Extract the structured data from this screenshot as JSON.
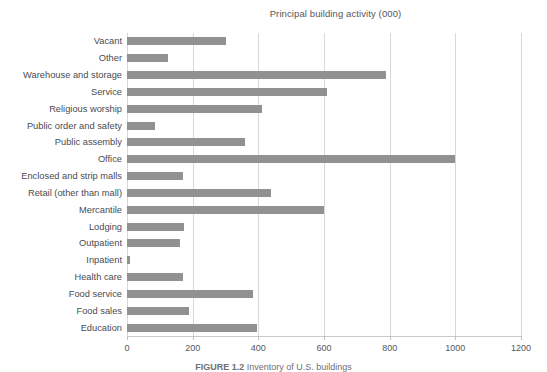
{
  "chart_data": {
    "type": "bar",
    "orientation": "horizontal",
    "title": "Principal building activity (000)",
    "xlabel": "",
    "ylabel": "",
    "xlim": [
      0,
      1200
    ],
    "xticks": [
      0,
      200,
      400,
      600,
      800,
      1000,
      1200
    ],
    "xtick_labels": [
      "0",
      "200",
      "400",
      "600",
      "800",
      "1000",
      "1200"
    ],
    "grid": "vertical",
    "legend": "none",
    "bar_color": "#919191",
    "categories": [
      "Vacant",
      "Other",
      "Warehouse and storage",
      "Service",
      "Religious worship",
      "Public order and safety",
      "Public assembly",
      "Office",
      "Enclosed and strip malls",
      "Retail (other than mall)",
      "Mercantile",
      "Lodging",
      "Outpatient",
      "Inpatient",
      "Health care",
      "Food service",
      "Food sales",
      "Education"
    ],
    "values": [
      300,
      125,
      790,
      610,
      410,
      85,
      360,
      1000,
      170,
      440,
      600,
      175,
      160,
      10,
      170,
      385,
      190,
      395
    ]
  },
  "caption": {
    "figure_label": "FIGURE 1.2",
    "text": "Inventory of U.S. buildings"
  }
}
